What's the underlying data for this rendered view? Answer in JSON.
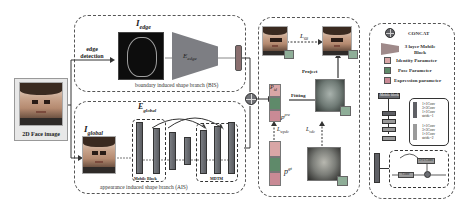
{
  "diagram": {
    "input": {
      "label": "2D Face image"
    },
    "edge_detection_label": [
      "edge",
      "detection"
    ],
    "bis": {
      "image_label": "I",
      "image_sub": "edge",
      "encoder_label": "E",
      "encoder_sub": "edge",
      "branch_label": "boundary induced shape branch (BIS)"
    },
    "ais": {
      "image_label": "I",
      "image_sub": "global",
      "encoder_label": "E",
      "encoder_sub": "global",
      "mobile_block_label": "Mobile Block",
      "mdtm_label": "MDTM",
      "branch_label": "appearance induced shape branch (AIS)"
    },
    "fitting": {
      "p_id_label": "P",
      "p_id_sub": "id",
      "p_pre_label": "p",
      "p_pre_sup": "pre",
      "p_gt_label": "p",
      "p_gt_sup": "gt",
      "fitting_label": "Fitting",
      "project_label": "Project",
      "l_68_label": "L",
      "l_68_sub": "68",
      "l_wpdc_label": "L",
      "l_wpdc_sub": "wpdc",
      "l_vdc_label": "L",
      "l_vdc_sub": "vdc",
      "face_gt_2d_tag": "I^gt_2d",
      "face_pre_2d_tag": "I^pre_2d",
      "mesh_pre_tag": "I^pre_3d",
      "mesh_gt_tag": "I^gt_3d"
    },
    "legend": {
      "items": [
        {
          "icon": "concat-icon",
          "label": "CONCAT"
        },
        {
          "icon": "mobile-block-icon",
          "label": "3 layer Mobile Block"
        },
        {
          "icon": "identity-param-icon",
          "label": "Identity Parameter"
        },
        {
          "icon": "pose-param-icon",
          "label": "Pose Parameter"
        },
        {
          "icon": "expression-param-icon",
          "label": "Expression parameter"
        }
      ],
      "mobile_block_box": "Mobile block",
      "conv_a": [
        "1×1Conv",
        "3×3Conv",
        "1×1Conv",
        "stride=1"
      ],
      "conv_b": [
        "1×1Conv",
        "3×3Conv",
        "1×1Conv",
        "stride=2"
      ],
      "attn_top": "1×1 Conv",
      "attn_mid": "Conv"
    },
    "colors": {
      "dashed_border": "#555555",
      "block_gray": "#6b6d72",
      "identity_pink": "#d9a6a6",
      "pose_green": "#5f8a6a",
      "expression_pink": "#c98a95",
      "mesh_green": "#6f9a7c"
    }
  }
}
